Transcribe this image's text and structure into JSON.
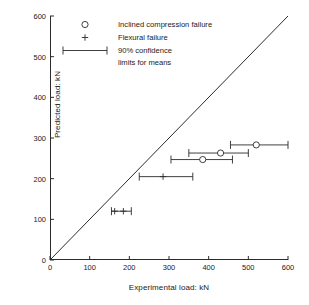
{
  "chart_data": {
    "type": "scatter",
    "title": "",
    "xlabel": "Experimental load: kN",
    "ylabel": "Predicted load: kN",
    "xlim": [
      0,
      600
    ],
    "ylim": [
      0,
      600
    ],
    "xticks": [
      0,
      100,
      200,
      300,
      400,
      500,
      600
    ],
    "yticks": [
      0,
      100,
      200,
      300,
      400,
      500,
      600
    ],
    "grid": false,
    "legend_position": "top-left",
    "reference_line": {
      "name": "line-of-equality",
      "from": [
        0,
        0
      ],
      "to": [
        600,
        600
      ]
    },
    "legend": [
      {
        "marker": "circle",
        "label": "Inclined compression failure"
      },
      {
        "marker": "plus",
        "label": "Flexural failure"
      },
      {
        "marker": "errorbar",
        "label": "90% confidence",
        "label2": "limits for means"
      }
    ],
    "series": [
      {
        "name": "Inclined compression failure",
        "marker": "circle",
        "points": [
          {
            "x": 385,
            "y": 247,
            "xlow": 305,
            "xhigh": 460
          },
          {
            "x": 430,
            "y": 263,
            "xlow": 350,
            "xhigh": 500
          },
          {
            "x": 520,
            "y": 283,
            "xlow": 455,
            "xhigh": 600
          }
        ]
      },
      {
        "name": "Flexural failure",
        "marker": "plus",
        "points": [
          {
            "x": 163,
            "y": 120,
            "xlow": 155,
            "xhigh": 205
          },
          {
            "x": 185,
            "y": 120,
            "xlow": 155,
            "xhigh": 205
          },
          {
            "x": 285,
            "y": 205,
            "xlow": 225,
            "xhigh": 360
          }
        ]
      }
    ]
  },
  "axes": {
    "x": {
      "label": "Experimental load: kN",
      "ticks": [
        "0",
        "100",
        "200",
        "300",
        "400",
        "500",
        "600"
      ]
    },
    "y": {
      "label": "Predicted load: kN",
      "ticks": [
        "0",
        "100",
        "200",
        "300",
        "400",
        "500",
        "600"
      ]
    }
  },
  "legend": {
    "entry1": "Inclined compression failure",
    "entry2": "Flexural failure",
    "entry3_line1": "90% confidence",
    "entry3_line2": "limits for means"
  },
  "colors": {
    "axis": "#2b2b2b",
    "marker": "#2b2b2b",
    "background": "#ffffff"
  }
}
